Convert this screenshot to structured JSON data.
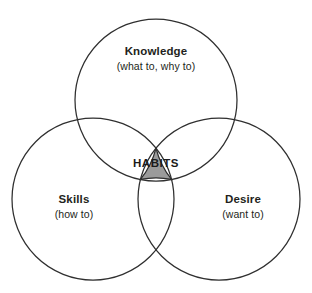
{
  "figure": {
    "background_color": "#ffffff",
    "stroke_color": "#2f2f2f",
    "highlight_fill": "#9b9b9b",
    "text_color": "#231f20",
    "cropped_caption_remnant": ""
  },
  "chart_data": {
    "type": "diagram",
    "diagram_type": "venn",
    "title": "",
    "sets": [
      {
        "id": "knowledge",
        "label": "Knowledge",
        "sublabel": "(what to, why to)",
        "position": "top",
        "center": [
          156,
          100
        ],
        "radius": 81,
        "fill": "none"
      },
      {
        "id": "skills",
        "label": "Skills",
        "sublabel": "(how to)",
        "position": "bottom-left",
        "center": [
          93,
          199
        ],
        "radius": 81,
        "fill": "none"
      },
      {
        "id": "desire",
        "label": "Desire",
        "sublabel": "(want to)",
        "position": "bottom-right",
        "center": [
          219,
          199
        ],
        "radius": 81,
        "fill": "none"
      }
    ],
    "intersections": [
      {
        "id": "habits",
        "label": "HABITS",
        "members": [
          "knowledge",
          "skills",
          "desire"
        ],
        "fill": "#9b9b9b",
        "center": [
          156,
          163
        ]
      }
    ],
    "legend": "none",
    "grid": false
  },
  "labels": {
    "knowledge": {
      "title": "Knowledge",
      "subtitle": "(what to, why to)"
    },
    "skills": {
      "title": "Skills",
      "subtitle": "(how to)"
    },
    "desire": {
      "title": "Desire",
      "subtitle": "(want to)"
    },
    "center": {
      "title": "HABITS"
    }
  }
}
